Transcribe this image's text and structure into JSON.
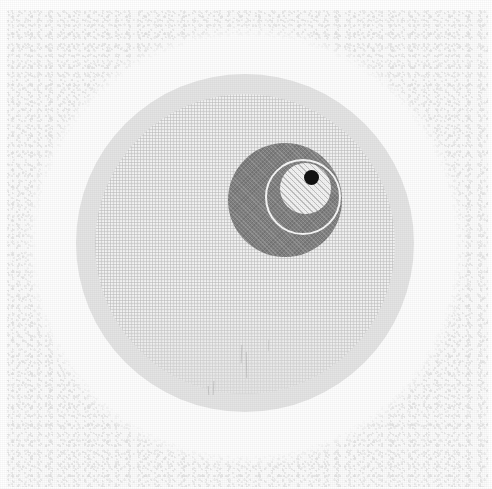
{
  "figure": {
    "background_color": "#fbfbfb",
    "canvas": {
      "width": 492,
      "height": 489
    }
  },
  "layers": [
    {
      "id": "paper-background",
      "label": "Speckled paper background",
      "shape": "rectangle",
      "fill": "#fbfbfb",
      "texture": "speckled"
    },
    {
      "id": "outer-halo-ring",
      "label": "Outer white halo ring",
      "shape": "circle",
      "center_x": 246,
      "center_y": 246,
      "radius": 210,
      "fill": "#fdfdfd",
      "texture": "plain"
    },
    {
      "id": "grey-annulus",
      "label": "Light grey annulus",
      "shape": "circle",
      "center_x": 245,
      "center_y": 243,
      "radius": 169,
      "fill": "#e4e4e4",
      "texture": "plain"
    },
    {
      "id": "mesh-field",
      "label": "Inner mesh grid field",
      "shape": "circle",
      "center_x": 245,
      "center_y": 244,
      "radius": 150,
      "fill": "#f3f3f3",
      "texture": "fine-grid"
    },
    {
      "id": "dark-nucleus",
      "label": "Dark grey nucleus disc",
      "shape": "circle",
      "center_x": 285,
      "center_y": 200,
      "radius": 57,
      "fill": "#818181",
      "texture": "cross-hatch"
    },
    {
      "id": "white-outline-ring",
      "label": "White outline ring",
      "shape": "circle",
      "center_x": 303,
      "center_y": 197,
      "radius": 38,
      "fill": "none",
      "stroke": "#f7f7f7",
      "stroke_width": 2
    },
    {
      "id": "hatched-inner-disc",
      "label": "Hatched inner disc",
      "shape": "circle",
      "center_x": 305,
      "center_y": 188,
      "radius": 25,
      "fill": "#f2f2f2",
      "texture": "diagonal-hatch"
    },
    {
      "id": "black-dot",
      "label": "Small black dot",
      "shape": "circle",
      "center_x": 311,
      "center_y": 177,
      "radius": 7,
      "fill": "#121212",
      "texture": "solid"
    }
  ],
  "marks": [
    {
      "id": "scratch-1",
      "label": "Faint vertical scratch"
    },
    {
      "id": "scratch-2",
      "label": "Faint vertical scratch"
    },
    {
      "id": "scratch-3",
      "label": "Faint vertical scratch"
    },
    {
      "id": "scratch-4",
      "label": "Faint vertical scratch"
    },
    {
      "id": "scratch-5",
      "label": "Faint vertical scratch"
    }
  ]
}
